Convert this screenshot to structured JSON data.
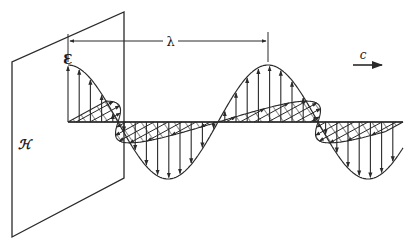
{
  "figure": {
    "labels": {
      "electric_field": "Ɛ",
      "magnetic_field": "ℋ",
      "wavelength": "λ",
      "velocity": "c"
    },
    "colors": {
      "ink": "#2a2a2a",
      "background": "#ffffff"
    },
    "geometry": {
      "axis_y": 122,
      "axis_x_start": 68,
      "axis_x_end": 403,
      "e_amplitude": 57,
      "wavelength_px": 200,
      "wavelength_marker": {
        "x1": 68,
        "x2": 268,
        "y": 41
      },
      "plate": [
        [
          12,
          62
        ],
        [
          124,
          12
        ],
        [
          124,
          178
        ],
        [
          12,
          237
        ]
      ],
      "velocity_arrow": {
        "x1": 353,
        "x2": 382,
        "y": 65
      }
    }
  }
}
